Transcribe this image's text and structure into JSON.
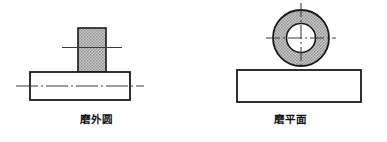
{
  "figure": {
    "title": "",
    "background_color": "#ffffff",
    "outline_color": "#1a1a1a",
    "wheel_fill_color": "#a9a9a9",
    "workpiece_fill_color": "#ffffff",
    "centerline_color": "#333333",
    "panels": [
      {
        "id": "cylindrical-grinding",
        "caption": "磨外圆",
        "wheel_shape": "rectangle",
        "workpiece_shape": "rectangle",
        "has_horizontal_centerline": true,
        "has_workpiece_centerline": true,
        "has_vertical_centerline": false
      },
      {
        "id": "surface-grinding",
        "caption": "磨平面",
        "wheel_shape": "annulus",
        "workpiece_shape": "rectangle",
        "has_horizontal_centerline": true,
        "has_workpiece_centerline": false,
        "has_vertical_centerline": true
      }
    ]
  }
}
